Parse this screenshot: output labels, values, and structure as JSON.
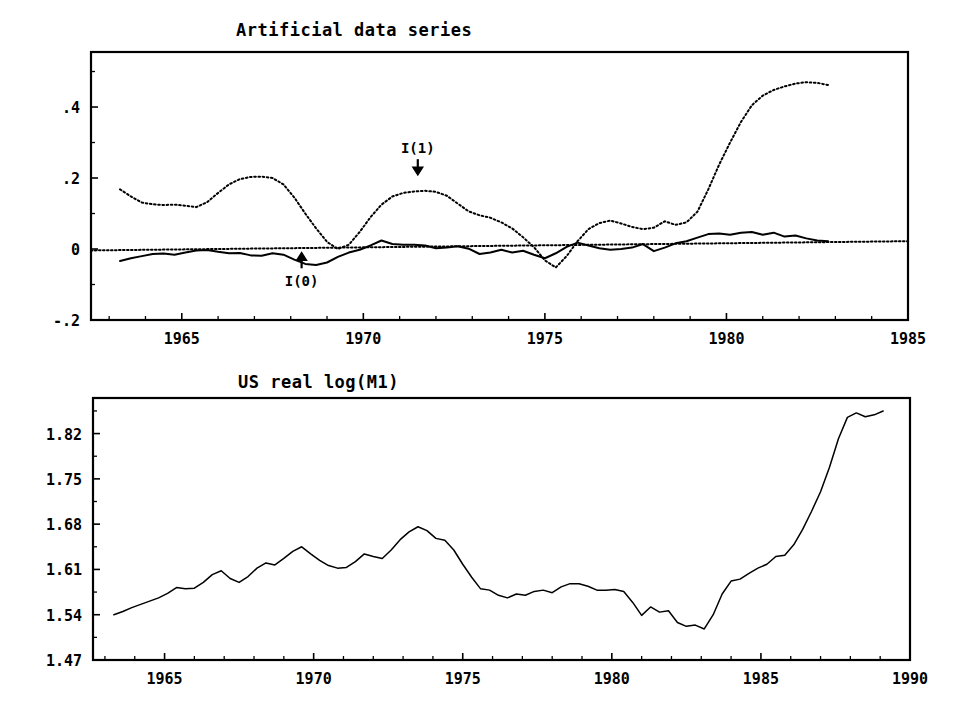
{
  "figure": {
    "width": 956,
    "height": 720,
    "background": "#ffffff",
    "ink_color": "#000000"
  },
  "chart_data": [
    {
      "id": "artificial-data-series",
      "type": "line",
      "title": "Artificial data series",
      "xlabel": "",
      "ylabel": "",
      "xlim": [
        1962.5,
        1985.0
      ],
      "ylim": [
        -0.2,
        0.555
      ],
      "grid": false,
      "legend": "none",
      "x_ticks": [
        1965,
        1970,
        1975,
        1980,
        1985
      ],
      "x_tick_labels": [
        "1965",
        "1970",
        "1975",
        "1980",
        "1985"
      ],
      "x_minor_tick_step": 1,
      "y_ticks": [
        -0.2,
        0.0,
        0.2,
        0.4
      ],
      "y_tick_labels": [
        "-.2",
        "0",
        ".2",
        ".4"
      ],
      "y_minor_ticks": [
        -0.1,
        0.1,
        0.3,
        0.5
      ],
      "annotations": [
        {
          "label": "I(1)",
          "x": 1971.5,
          "y": 0.27,
          "arrow": "down",
          "points_to_series": "I(1)"
        },
        {
          "label": "I(0)",
          "x": 1968.3,
          "y": -0.105,
          "arrow": "up",
          "points_to_series": "I(0)"
        }
      ],
      "reference_line": {
        "style": "dotted",
        "x": [
          1962.5,
          1985.0
        ],
        "y": [
          -0.004,
          0.022
        ]
      },
      "series": [
        {
          "name": "I(1)",
          "style": "dotted",
          "x": [
            1963.3,
            1963.6,
            1963.9,
            1964.2,
            1964.5,
            1964.8,
            1965.1,
            1965.4,
            1965.7,
            1966.0,
            1966.3,
            1966.6,
            1966.9,
            1967.2,
            1967.5,
            1967.8,
            1968.1,
            1968.4,
            1968.7,
            1969.0,
            1969.3,
            1969.6,
            1969.9,
            1970.2,
            1970.5,
            1970.8,
            1971.1,
            1971.4,
            1971.7,
            1972.0,
            1972.3,
            1972.6,
            1972.9,
            1973.2,
            1973.5,
            1973.8,
            1974.1,
            1974.4,
            1974.7,
            1975.0,
            1975.3,
            1975.6,
            1975.9,
            1976.2,
            1976.5,
            1976.8,
            1977.1,
            1977.4,
            1977.7,
            1978.0,
            1978.3,
            1978.6,
            1978.9,
            1979.2,
            1979.5,
            1979.8,
            1980.1,
            1980.4,
            1980.7,
            1981.0,
            1981.3,
            1981.6,
            1981.9,
            1982.2,
            1982.5,
            1982.8
          ],
          "y": [
            0.168,
            0.148,
            0.131,
            0.126,
            0.124,
            0.125,
            0.122,
            0.118,
            0.132,
            0.158,
            0.182,
            0.197,
            0.203,
            0.204,
            0.2,
            0.182,
            0.145,
            0.1,
            0.058,
            0.02,
            0.0,
            0.012,
            0.048,
            0.09,
            0.125,
            0.148,
            0.158,
            0.162,
            0.164,
            0.161,
            0.15,
            0.128,
            0.106,
            0.095,
            0.088,
            0.075,
            0.058,
            0.033,
            0.005,
            -0.032,
            -0.052,
            -0.02,
            0.022,
            0.056,
            0.073,
            0.08,
            0.072,
            0.062,
            0.056,
            0.06,
            0.078,
            0.068,
            0.075,
            0.105,
            0.168,
            0.238,
            0.3,
            0.358,
            0.405,
            0.432,
            0.448,
            0.458,
            0.466,
            0.47,
            0.468,
            0.462
          ]
        },
        {
          "name": "I(0)",
          "style": "solid",
          "x": [
            1963.3,
            1963.6,
            1963.9,
            1964.2,
            1964.5,
            1964.8,
            1965.1,
            1965.4,
            1965.7,
            1966.0,
            1966.3,
            1966.6,
            1966.9,
            1967.2,
            1967.5,
            1967.8,
            1968.1,
            1968.4,
            1968.7,
            1969.0,
            1969.3,
            1969.6,
            1969.9,
            1970.2,
            1970.5,
            1970.8,
            1971.1,
            1971.4,
            1971.7,
            1972.0,
            1972.3,
            1972.6,
            1972.9,
            1973.2,
            1973.5,
            1973.8,
            1974.1,
            1974.4,
            1974.7,
            1975.0,
            1975.3,
            1975.6,
            1975.9,
            1976.2,
            1976.5,
            1976.8,
            1977.1,
            1977.4,
            1977.7,
            1978.0,
            1978.3,
            1978.6,
            1978.9,
            1979.2,
            1979.5,
            1979.8,
            1980.1,
            1980.4,
            1980.7,
            1981.0,
            1981.3,
            1981.6,
            1981.9,
            1982.2,
            1982.5,
            1982.8
          ],
          "y": [
            -0.034,
            -0.026,
            -0.02,
            -0.014,
            -0.013,
            -0.016,
            -0.01,
            -0.004,
            -0.003,
            -0.008,
            -0.012,
            -0.011,
            -0.018,
            -0.019,
            -0.012,
            -0.016,
            -0.03,
            -0.042,
            -0.045,
            -0.038,
            -0.022,
            -0.01,
            -0.002,
            0.01,
            0.024,
            0.014,
            0.012,
            0.012,
            0.01,
            0.002,
            0.004,
            0.008,
            0.001,
            -0.014,
            -0.01,
            -0.002,
            -0.01,
            -0.005,
            -0.016,
            -0.026,
            -0.012,
            0.006,
            0.018,
            0.01,
            0.002,
            -0.002,
            0.0,
            0.004,
            0.014,
            -0.006,
            0.004,
            0.016,
            0.022,
            0.032,
            0.042,
            0.044,
            0.04,
            0.046,
            0.048,
            0.04,
            0.046,
            0.035,
            0.038,
            0.03,
            0.024,
            0.022
          ]
        }
      ]
    },
    {
      "id": "us-real-log-m1",
      "type": "line",
      "title": "US real log(M1)",
      "xlabel": "",
      "ylabel": "",
      "xlim": [
        1962.6,
        1990.0
      ],
      "ylim": [
        1.47,
        1.875
      ],
      "grid": false,
      "legend": "none",
      "x_ticks": [
        1965,
        1970,
        1975,
        1980,
        1985,
        1990
      ],
      "x_tick_labels": [
        "1965",
        "1970",
        "1975",
        "1980",
        "1985",
        "1990"
      ],
      "x_minor_tick_step": 1,
      "y_ticks": [
        1.47,
        1.54,
        1.61,
        1.68,
        1.75,
        1.82
      ],
      "y_tick_labels": [
        "1.47",
        "1.54",
        "1.61",
        "1.68",
        "1.75",
        "1.82"
      ],
      "y_minor_ticks": [
        1.505,
        1.575,
        1.645,
        1.715,
        1.785,
        1.855
      ],
      "series": [
        {
          "name": "US real log(M1)",
          "style": "solid",
          "x": [
            1963.3,
            1963.6,
            1963.9,
            1964.2,
            1964.5,
            1964.8,
            1965.1,
            1965.4,
            1965.7,
            1966.0,
            1966.3,
            1966.6,
            1966.9,
            1967.2,
            1967.5,
            1967.8,
            1968.1,
            1968.4,
            1968.7,
            1969.0,
            1969.3,
            1969.6,
            1969.9,
            1970.2,
            1970.5,
            1970.8,
            1971.1,
            1971.4,
            1971.7,
            1972.0,
            1972.3,
            1972.6,
            1972.9,
            1973.2,
            1973.5,
            1973.8,
            1974.1,
            1974.4,
            1974.7,
            1975.0,
            1975.3,
            1975.6,
            1975.9,
            1976.2,
            1976.5,
            1976.8,
            1977.1,
            1977.4,
            1977.7,
            1978.0,
            1978.3,
            1978.6,
            1978.9,
            1979.2,
            1979.5,
            1979.8,
            1980.1,
            1980.4,
            1980.7,
            1981.0,
            1981.3,
            1981.6,
            1981.9,
            1982.2,
            1982.5,
            1982.8,
            1983.1,
            1983.4,
            1983.7,
            1984.0,
            1984.3,
            1984.6,
            1984.9,
            1985.2,
            1985.5,
            1985.8,
            1986.1,
            1986.4,
            1986.7,
            1987.0,
            1987.3,
            1987.6,
            1987.9,
            1988.2,
            1988.5,
            1988.8,
            1989.1
          ],
          "y": [
            1.54,
            1.545,
            1.551,
            1.556,
            1.561,
            1.566,
            1.573,
            1.582,
            1.58,
            1.581,
            1.59,
            1.602,
            1.608,
            1.596,
            1.59,
            1.599,
            1.612,
            1.62,
            1.617,
            1.627,
            1.638,
            1.645,
            1.634,
            1.624,
            1.616,
            1.612,
            1.613,
            1.622,
            1.634,
            1.63,
            1.627,
            1.64,
            1.656,
            1.668,
            1.676,
            1.67,
            1.658,
            1.655,
            1.64,
            1.618,
            1.598,
            1.58,
            1.578,
            1.57,
            1.566,
            1.572,
            1.57,
            1.576,
            1.578,
            1.574,
            1.583,
            1.588,
            1.588,
            1.584,
            1.578,
            1.578,
            1.579,
            1.576,
            1.559,
            1.539,
            1.552,
            1.544,
            1.546,
            1.528,
            1.522,
            1.524,
            1.518,
            1.54,
            1.572,
            1.592,
            1.595,
            1.604,
            1.612,
            1.618,
            1.63,
            1.632,
            1.648,
            1.672,
            1.7,
            1.73,
            1.768,
            1.812,
            1.845,
            1.852,
            1.846,
            1.849,
            1.855
          ]
        }
      ]
    }
  ]
}
